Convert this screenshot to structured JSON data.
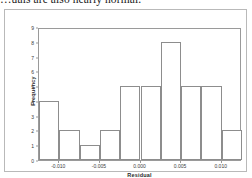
{
  "page": {
    "clipped_caption": "…uals are also nearly normal."
  },
  "chart_data": {
    "type": "bar",
    "title": "",
    "subtitle": "",
    "xlabel": "Residual",
    "ylabel": "Frequency",
    "xlim": [
      -0.0125,
      0.0125
    ],
    "ylim": [
      0,
      9
    ],
    "grid": false,
    "legend": null,
    "bin_width": 0.0025,
    "categories": [
      "-0.0125 to -0.0100",
      "-0.0100 to -0.0075",
      "-0.0075 to -0.0050",
      "-0.0050 to -0.0025",
      "-0.0025 to 0.0000",
      "0.0000 to 0.0025",
      "0.0025 to 0.0050",
      "0.0050 to 0.0075",
      "0.0075 to 0.0100",
      "0.0100 to 0.0125"
    ],
    "bin_edges": [
      -0.0125,
      -0.01,
      -0.0075,
      -0.005,
      -0.0025,
      0.0,
      0.0025,
      0.005,
      0.0075,
      0.01,
      0.0125
    ],
    "values": [
      4,
      2,
      1,
      2,
      5,
      5,
      8,
      5,
      5,
      2
    ],
    "y_ticks": [
      0,
      1,
      2,
      3,
      4,
      5,
      6,
      7,
      8,
      9
    ],
    "y_tick_labels": [
      "0",
      "1",
      "2",
      "3",
      "4",
      "5",
      "6",
      "7",
      "8",
      "9"
    ],
    "x_ticks": [
      -0.01,
      -0.005,
      0.0,
      0.005,
      0.01
    ],
    "x_tick_labels": [
      "-0.010",
      "-0.005",
      "0.000",
      "0.005",
      "0.010"
    ],
    "colors": {
      "bar_fill": "#ffffff",
      "bar_edge": "#8d8d8d",
      "axis": "#9a9a9a",
      "figure_border": "#b9b9b9",
      "text": "#2a2a2a"
    }
  }
}
